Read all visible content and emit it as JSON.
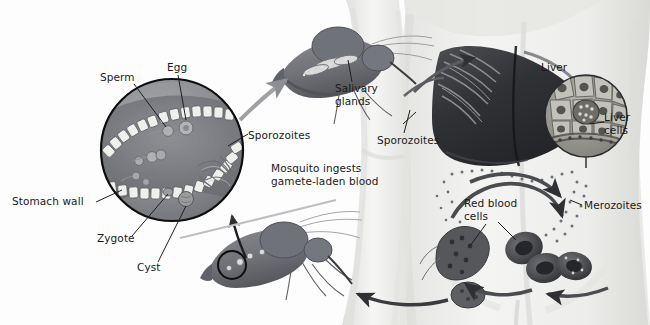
{
  "figure": {
    "background_color": "#fdfdfd",
    "text_color": "#1a1a1a",
    "width": 650,
    "height": 325
  },
  "labels": [
    {
      "id": "sperm",
      "text": "Sperm",
      "x": 100,
      "y": 71,
      "align": "left"
    },
    {
      "id": "egg",
      "text": "Egg",
      "x": 167,
      "y": 61,
      "align": "left"
    },
    {
      "id": "sporozoites_gut",
      "text": "Sporozoites",
      "x": 248,
      "y": 129,
      "align": "left"
    },
    {
      "id": "stomach_wall",
      "text": "Stomach wall",
      "x": 12,
      "y": 195,
      "align": "left"
    },
    {
      "id": "zygote",
      "text": "Zygote",
      "x": 97,
      "y": 232,
      "align": "left"
    },
    {
      "id": "cyst",
      "text": "Cyst",
      "x": 137,
      "y": 261,
      "align": "left"
    },
    {
      "id": "salivary_glands",
      "text": "Salivary\nglands",
      "x": 335,
      "y": 82,
      "align": "left"
    },
    {
      "id": "sporozoites_arm",
      "text": "Sporozoites",
      "x": 377,
      "y": 134,
      "align": "left"
    },
    {
      "id": "mosquito_ingests",
      "text": "Mosquito ingests\ngamete-laden blood",
      "x": 271,
      "y": 162,
      "align": "left"
    },
    {
      "id": "liver",
      "text": "Liver",
      "x": 541,
      "y": 61,
      "align": "left"
    },
    {
      "id": "liver_cells",
      "text": "Liver\ncells",
      "x": 604,
      "y": 111,
      "align": "left"
    },
    {
      "id": "red_blood_cells",
      "text": "Red blood\ncells",
      "x": 464,
      "y": 197,
      "align": "left"
    },
    {
      "id": "merozoites",
      "text": "Merozoites",
      "x": 584,
      "y": 199,
      "align": "left"
    }
  ],
  "palette": {
    "body_skin": "#efefee",
    "body_shade": "#dcdcda",
    "liver_dark": "#2f3033",
    "liver_mid": "#4a4c50",
    "mosquito_body": "#76787e",
    "mosquito_dark": "#5a5c61",
    "stomach_wall": "#9a9a9a",
    "stomach_lumen": "#7d7f84",
    "arrow_gray": "#6f7175",
    "arrow_dark": "#3b3c40",
    "cell_light": "#e8e8e6",
    "rbc_dark": "#4e5054",
    "outline": "#111111"
  },
  "figure_parts": [
    {
      "id": "magnified-stomach-circle",
      "kind": "circle",
      "cx": 172,
      "cy": 150,
      "r": 72
    },
    {
      "id": "liver-cells-inset-circle",
      "kind": "circle",
      "cx": 586,
      "cy": 116,
      "r": 42
    },
    {
      "id": "mosquito-top",
      "kind": "mosquito",
      "cx": 330,
      "cy": 70
    },
    {
      "id": "mosquito-bottom",
      "kind": "mosquito",
      "cx": 268,
      "cy": 248
    },
    {
      "id": "human-torso",
      "kind": "torso"
    },
    {
      "id": "liver-organ",
      "kind": "liver"
    },
    {
      "id": "red-blood-cells-cluster",
      "kind": "rbc"
    },
    {
      "id": "merozoite-dots",
      "kind": "dots"
    }
  ]
}
